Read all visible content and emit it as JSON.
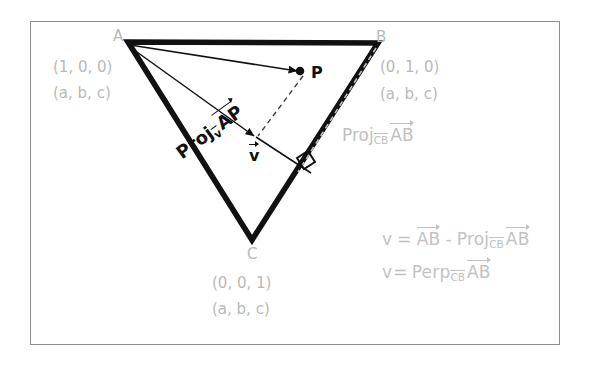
{
  "figure": {
    "background": "#ffffff",
    "frame_color": "#8e8e8e",
    "label_color": "#b9b9b9",
    "ink_color": "#111111"
  },
  "vertices": [
    {
      "id": "A",
      "letter": "A",
      "barycentric": "(1, 0, 0)",
      "generic": "(a, b, c)",
      "x": 128,
      "y": 42
    },
    {
      "id": "B",
      "letter": "B",
      "barycentric": "(0, 1, 0)",
      "generic": "(a, b, c)",
      "x": 378,
      "y": 43
    },
    {
      "id": "C",
      "letter": "C",
      "barycentric": "(0, 0, 1)",
      "generic": "(a, b, c)",
      "x": 252,
      "y": 240
    }
  ],
  "points": [
    {
      "id": "P",
      "label": "P",
      "x": 306,
      "y": 72
    }
  ],
  "vectors": {
    "v_label": "v",
    "proj_ap": {
      "prefix": "Proj",
      "sub": "v",
      "operand": "AP"
    },
    "proj_cb_ab": {
      "prefix": "Proj",
      "sub": "CB",
      "operand": "AB"
    }
  },
  "equations": [
    {
      "lhs": "v",
      "eq": "=",
      "term1": "AB",
      "op": "-",
      "fn": "Proj",
      "sub": "CB",
      "operand": "AB"
    },
    {
      "lhs": "v",
      "eq": "=",
      "fn": "Perp",
      "sub": "CB",
      "operand": "AB"
    }
  ],
  "annotations": {
    "right_angle": "right-angle-marker",
    "dashed_from_p": "dashed-projection-line",
    "dashed_along_cb": "dashed-cb-extension"
  }
}
